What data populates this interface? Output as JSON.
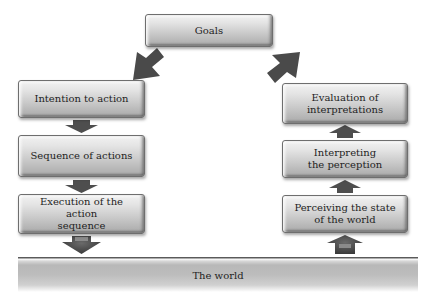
{
  "diagram": {
    "goals": {
      "label": "Goals"
    },
    "left_column": [
      {
        "id": "intention",
        "label": "Intention to action"
      },
      {
        "id": "sequence",
        "label": "Sequence of actions"
      },
      {
        "id": "execution",
        "label": "Execution of the action sequence",
        "lines": [
          "Execution of the action",
          "sequence"
        ]
      }
    ],
    "right_column": [
      {
        "id": "evaluation",
        "label": "Evaluation of interpretations",
        "lines": [
          "Evaluation of",
          "interpretations"
        ]
      },
      {
        "id": "interpreting",
        "label": "Interpreting the perception",
        "lines": [
          "Interpreting",
          "the perception"
        ]
      },
      {
        "id": "perceiving",
        "label": "Perceiving the state of the world",
        "lines": [
          "Perceiving the state",
          "of the world"
        ]
      }
    ],
    "world": {
      "label": "The world"
    },
    "edges": [
      {
        "from": "Goals",
        "to": "Intention to action",
        "direction": "down-left"
      },
      {
        "from": "Intention to action",
        "to": "Sequence of actions",
        "direction": "down"
      },
      {
        "from": "Sequence of actions",
        "to": "Execution of the action sequence",
        "direction": "down"
      },
      {
        "from": "Execution of the action sequence",
        "to": "The world",
        "direction": "down"
      },
      {
        "from": "The world",
        "to": "Perceiving the state of the world",
        "direction": "up"
      },
      {
        "from": "Perceiving the state of the world",
        "to": "Interpreting the perception",
        "direction": "up"
      },
      {
        "from": "Interpreting the perception",
        "to": "Evaluation of interpretations",
        "direction": "up"
      },
      {
        "from": "Evaluation of interpretations",
        "to": "Goals",
        "direction": "up-left"
      }
    ],
    "colors": {
      "arrow": "#4a4a4a",
      "box_border": "#6e6e6e",
      "text": "#1e1e1e"
    }
  }
}
